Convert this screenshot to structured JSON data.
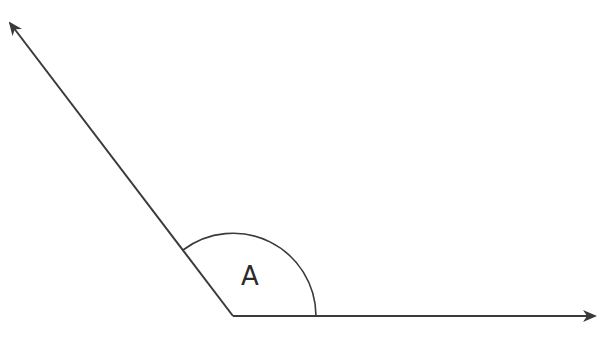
{
  "diagram": {
    "type": "angle",
    "angle_label": "A",
    "colors": {
      "stroke": "#3a3a3a",
      "background": "#ffffff"
    },
    "rays": [
      {
        "name": "left-ray",
        "direction": "upper-left"
      },
      {
        "name": "right-ray",
        "direction": "right"
      }
    ]
  }
}
